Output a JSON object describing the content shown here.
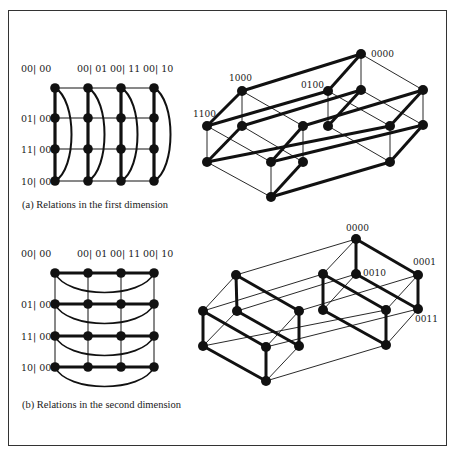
{
  "figure": {
    "panels": [
      {
        "id": "a",
        "caption": "(a) Relations in the first dimension",
        "grid": {
          "col_labels": [
            "00| 00",
            "00| 01",
            "00| 11",
            "00| 10"
          ],
          "row_labels": [
            "01| 00",
            "11| 00",
            "10| 00"
          ],
          "cols_x": [
            55,
            88,
            121,
            154
          ],
          "rows_y": [
            88,
            118,
            149,
            181
          ],
          "label_y": 72,
          "thick": "vertical",
          "arcs": "vertical-right"
        },
        "cube": {
          "labels": [
            {
              "text": "0000",
              "x": 371,
              "y": 57
            },
            {
              "text": "1000",
              "x": 229,
              "y": 81
            },
            {
              "text": "0100",
              "x": 301,
              "y": 88
            },
            {
              "text": "1100",
              "x": 193,
              "y": 117
            }
          ],
          "nodes": {
            "A": [
              361,
              54
            ],
            "B": [
              242,
              91
            ],
            "C": [
              328,
              91
            ],
            "D": [
              361,
              90
            ],
            "E": [
              423,
              90
            ],
            "F": [
              207,
              126
            ],
            "G": [
              242,
              126
            ],
            "H": [
              303,
              126
            ],
            "I": [
              328,
              126
            ],
            "J": [
              390,
              126
            ],
            "K": [
              423,
              125
            ],
            "L": [
              207,
              162
            ],
            "M": [
              271,
              162
            ],
            "N": [
              303,
              162
            ],
            "O": [
              390,
              162
            ],
            "P": [
              271,
              197
            ]
          },
          "thick_edges": [
            [
              "A",
              "B"
            ],
            [
              "A",
              "C"
            ],
            [
              "B",
              "F"
            ],
            [
              "F",
              "C"
            ],
            [
              "G",
              "D"
            ],
            [
              "D",
              "I"
            ],
            [
              "H",
              "E"
            ],
            [
              "G",
              "L"
            ],
            [
              "H",
              "M"
            ],
            [
              "L",
              "J"
            ],
            [
              "M",
              "K"
            ],
            [
              "K",
              "O"
            ],
            [
              "N",
              "P"
            ],
            [
              "P",
              "O"
            ],
            [
              "E",
              "J"
            ]
          ],
          "thin_edges": [
            [
              "A",
              "D"
            ],
            [
              "A",
              "E"
            ],
            [
              "B",
              "G"
            ],
            [
              "B",
              "H"
            ],
            [
              "C",
              "I"
            ],
            [
              "C",
              "J"
            ],
            [
              "D",
              "K"
            ],
            [
              "F",
              "L"
            ],
            [
              "F",
              "M"
            ],
            [
              "G",
              "N"
            ],
            [
              "H",
              "N"
            ],
            [
              "I",
              "O"
            ],
            [
              "J",
              "O"
            ],
            [
              "E",
              "K"
            ],
            [
              "L",
              "P"
            ],
            [
              "M",
              "P"
            ]
          ]
        }
      },
      {
        "id": "b",
        "caption": "(b) Relations in the second dimension",
        "grid": {
          "col_labels": [
            "00| 00",
            "00| 01",
            "00| 11",
            "00| 10"
          ],
          "row_labels": [
            "01| 00",
            "11| 00",
            "10| 00"
          ],
          "cols_x": [
            55,
            88,
            121,
            154
          ],
          "rows_y": [
            273,
            304,
            336,
            367
          ],
          "label_y": 257,
          "thick": "horizontal",
          "arcs": "horizontal-down"
        },
        "cube": {
          "labels": [
            {
              "text": "0000",
              "x": 346,
              "y": 231
            },
            {
              "text": "0010",
              "x": 363,
              "y": 276
            },
            {
              "text": "0001",
              "x": 413,
              "y": 265
            },
            {
              "text": "0011",
              "x": 415,
              "y": 322
            }
          ],
          "nodes": {
            "A": [
              356,
              239
            ],
            "B": [
              236,
              275
            ],
            "C": [
              323,
              274
            ],
            "D": [
              356,
              274
            ],
            "E": [
              418,
              275
            ],
            "F": [
              203,
              311
            ],
            "G": [
              237,
              311
            ],
            "H": [
              299,
              311
            ],
            "I": [
              323,
              310
            ],
            "J": [
              386,
              310
            ],
            "K": [
              418,
              309
            ],
            "L": [
              203,
              346
            ],
            "M": [
              266,
              347
            ],
            "N": [
              299,
              346
            ],
            "O": [
              386,
              345
            ],
            "P": [
              266,
              381
            ]
          },
          "thick_edges": [
            [
              "A",
              "D"
            ],
            [
              "A",
              "E"
            ],
            [
              "B",
              "G"
            ],
            [
              "B",
              "H"
            ],
            [
              "C",
              "I"
            ],
            [
              "C",
              "J"
            ],
            [
              "D",
              "K"
            ],
            [
              "E",
              "K"
            ],
            [
              "F",
              "L"
            ],
            [
              "F",
              "M"
            ],
            [
              "G",
              "N"
            ],
            [
              "H",
              "N"
            ],
            [
              "I",
              "O"
            ],
            [
              "J",
              "O"
            ],
            [
              "L",
              "P"
            ],
            [
              "M",
              "P"
            ]
          ],
          "thin_edges": [
            [
              "A",
              "B"
            ],
            [
              "A",
              "C"
            ],
            [
              "B",
              "F"
            ],
            [
              "C",
              "F"
            ],
            [
              "D",
              "G"
            ],
            [
              "E",
              "H"
            ],
            [
              "D",
              "I"
            ],
            [
              "G",
              "L"
            ],
            [
              "H",
              "M"
            ],
            [
              "K",
              "O"
            ],
            [
              "L",
              "J"
            ],
            [
              "M",
              "K"
            ],
            [
              "N",
              "P"
            ],
            [
              "P",
              "O"
            ],
            [
              "E",
              "J"
            ]
          ]
        }
      }
    ],
    "colors": {
      "ink": "#111111",
      "frame": "#333333",
      "background": "#ffffff"
    }
  }
}
